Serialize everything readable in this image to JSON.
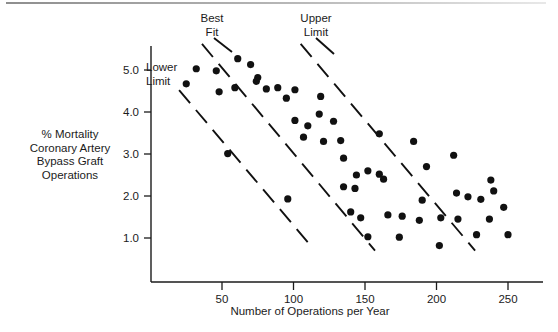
{
  "figure": {
    "y_axis_label_lines": [
      "% Mortality",
      "Coronary Artery",
      "Bypass Graft",
      "Operations"
    ],
    "x_axis_label": "Number of Operations per Year",
    "annotations": {
      "best_fit": [
        "Best",
        "Fit"
      ],
      "upper_limit": [
        "Upper",
        "Limit"
      ],
      "lower_limit": [
        "Lower",
        "Limit"
      ]
    }
  },
  "chart_data": {
    "type": "scatter",
    "title": "",
    "xlabel": "Number of Operations per Year",
    "ylabel": "% Mortality Coronary Artery Bypass Graft Operations",
    "xlim": [
      10,
      268
    ],
    "ylim": [
      0.25,
      5.75
    ],
    "xticks": [
      50,
      100,
      150,
      200,
      250
    ],
    "xtick_labels": [
      "50",
      "100",
      "150",
      "200",
      "250"
    ],
    "yticks": [
      1.0,
      2.0,
      3.0,
      4.0,
      5.0
    ],
    "ytick_labels": [
      "1.0",
      "2.0",
      "3.0",
      "4.0",
      "5.0"
    ],
    "grid": false,
    "legend": "none",
    "series": [
      {
        "name": "Hospitals",
        "marker": "filled-circle",
        "color": "#111111",
        "points": [
          [
            32,
            5.03
          ],
          [
            25,
            4.67
          ],
          [
            46,
            4.98
          ],
          [
            48,
            4.48
          ],
          [
            61,
            5.27
          ],
          [
            59,
            4.58
          ],
          [
            70,
            5.13
          ],
          [
            75,
            4.82
          ],
          [
            74,
            4.73
          ],
          [
            81,
            4.55
          ],
          [
            89,
            4.58
          ],
          [
            95,
            4.33
          ],
          [
            54,
            3.01
          ],
          [
            96,
            1.93
          ],
          [
            101,
            4.53
          ],
          [
            101,
            3.8
          ],
          [
            110,
            3.67
          ],
          [
            107,
            3.4
          ],
          [
            118,
            3.95
          ],
          [
            121,
            3.3
          ],
          [
            119,
            4.37
          ],
          [
            128,
            3.78
          ],
          [
            133,
            3.32
          ],
          [
            135,
            2.9
          ],
          [
            135,
            2.22
          ],
          [
            143,
            2.18
          ],
          [
            144,
            2.5
          ],
          [
            140,
            1.62
          ],
          [
            147,
            1.48
          ],
          [
            152,
            2.6
          ],
          [
            152,
            1.03
          ],
          [
            160,
            2.52
          ],
          [
            163,
            2.4
          ],
          [
            166,
            1.55
          ],
          [
            160,
            3.48
          ],
          [
            176,
            1.52
          ],
          [
            174,
            1.02
          ],
          [
            184,
            3.3
          ],
          [
            188,
            1.42
          ],
          [
            190,
            1.9
          ],
          [
            193,
            2.7
          ],
          [
            203,
            1.48
          ],
          [
            202,
            0.82
          ],
          [
            212,
            2.97
          ],
          [
            215,
            1.45
          ],
          [
            214,
            2.07
          ],
          [
            222,
            1.98
          ],
          [
            228,
            1.08
          ],
          [
            231,
            1.92
          ],
          [
            238,
            2.38
          ],
          [
            240,
            2.12
          ],
          [
            237,
            1.45
          ],
          [
            247,
            1.73
          ],
          [
            250,
            1.08
          ]
        ]
      }
    ],
    "reference_lines": [
      {
        "name": "Best Fit",
        "style": "dashed",
        "from": [
          36,
          5.62
        ],
        "to": [
          157,
          0.7
        ]
      },
      {
        "name": "Upper Limit",
        "style": "dashed",
        "from": [
          105,
          5.62
        ],
        "to": [
          227,
          0.7
        ]
      },
      {
        "name": "Lower Limit",
        "style": "dashed",
        "from": [
          20,
          4.52
        ],
        "to": [
          112,
          0.82
        ]
      }
    ]
  }
}
